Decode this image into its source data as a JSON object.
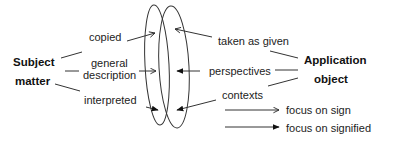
{
  "subject": {
    "line1": "Subject",
    "line2": "matter"
  },
  "application": {
    "line1": "Application",
    "line2": "object"
  },
  "left_labels": {
    "copied": "copied",
    "general_line1": "general",
    "general_line2": "description",
    "interpreted": "interpreted"
  },
  "right_labels": {
    "taken": "taken as given",
    "perspectives": "perspectives",
    "contexts": "contexts"
  },
  "legend": {
    "open_arrow": "focus on sign",
    "filled_arrow": "focus on signified"
  },
  "colors": {
    "stroke": "#2a2a2a",
    "text": "#222222",
    "background": "#ffffff"
  }
}
